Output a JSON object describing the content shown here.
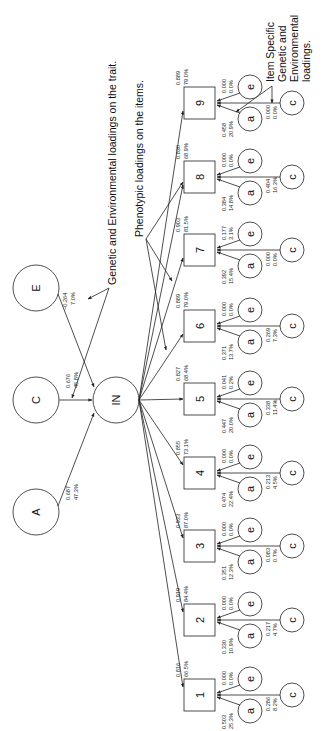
{
  "annotations": {
    "trait_loadings": "Genetic and Environmental loadings on the trait.",
    "phenotypic_loadings": "Phenotypic loadings on the items.",
    "item_specific": [
      "Item Specific",
      "Genetic and",
      "Environmental",
      "loadings."
    ]
  },
  "latent": {
    "A": {
      "label": "A",
      "loading": "0.687",
      "percent": "47.3%"
    },
    "C": {
      "label": "C",
      "loading": "0.676",
      "percent": "45.8%"
    },
    "E": {
      "label": "E",
      "loading": "−0.264",
      "percent": "7.0%"
    },
    "trait": {
      "label": "IN"
    }
  },
  "items": [
    {
      "label": "1",
      "phen": "0.816",
      "phen_pct": "66.5%",
      "a": "0.503",
      "a_pct": "25.3%",
      "c": "0.286",
      "c_pct": "8.2%",
      "e": "0.000",
      "e_pct": "0.0%"
    },
    {
      "label": "2",
      "phen": "0.919",
      "phen_pct": "84.4%",
      "a": "0.330",
      "a_pct": "10.9%",
      "c": "0.217",
      "c_pct": "4.7%",
      "e": "0.000",
      "e_pct": "0.0%"
    },
    {
      "label": "3",
      "phen": "0.933",
      "phen_pct": "87.0%",
      "a": "0.351",
      "a_pct": "12.3%",
      "c": "0.083",
      "c_pct": "0.7%",
      "e": "0.000",
      "e_pct": "0.0%"
    },
    {
      "label": "4",
      "phen": "0.855",
      "phen_pct": "73.1%",
      "a": "0.474",
      "a_pct": "22.4%",
      "c": "0.213",
      "c_pct": "4.5%",
      "e": "0.000",
      "e_pct": "0.0%"
    },
    {
      "label": "5",
      "phen": "0.827",
      "phen_pct": "68.4%",
      "a": "0.447",
      "a_pct": "20.0%",
      "c": "0.338",
      "c_pct": "11.4%",
      "e": "0.041",
      "e_pct": "0.2%"
    },
    {
      "label": "6",
      "phen": "0.889",
      "phen_pct": "79.0%",
      "a": "0.371",
      "a_pct": "13.7%",
      "c": "0.269",
      "c_pct": "7.3%",
      "e": "0.000",
      "e_pct": "0.0%"
    },
    {
      "label": "7",
      "phen": "0.903",
      "phen_pct": "81.5%",
      "a": "0.392",
      "a_pct": "15.4%",
      "c": "0.000",
      "c_pct": "0.0%",
      "e": "0.177",
      "e_pct": "3.1%"
    },
    {
      "label": "8",
      "phen": "0.830",
      "phen_pct": "68.9%",
      "a": "0.384",
      "a_pct": "14.8%",
      "c": "0.404",
      "c_pct": "16.3%",
      "e": "0.000",
      "e_pct": "0.0%"
    },
    {
      "label": "9",
      "phen": "0.889",
      "phen_pct": "79.0%",
      "a": "0.458",
      "a_pct": "20.9%",
      "c": "0.000",
      "c_pct": "0.0%",
      "e": "0.000",
      "e_pct": "0.0%"
    }
  ],
  "item_specific_labels": {
    "a": "a",
    "c": "c",
    "e": "e"
  },
  "colors": {
    "stroke": "#222222",
    "background": "#ffffff"
  }
}
